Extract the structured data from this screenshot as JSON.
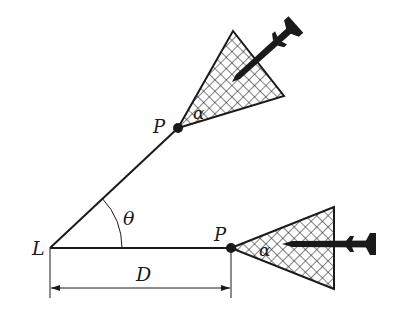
{
  "diagram": {
    "labels": {
      "launcher": "L",
      "point_upper": "P",
      "point_lower": "P",
      "angle_theta": "θ",
      "alpha_upper": "α",
      "alpha_lower": "α",
      "distance": "D"
    },
    "colors": {
      "line": "#1a1a1a",
      "hatch": "#1a1a1a",
      "background": "#ffffff"
    }
  }
}
